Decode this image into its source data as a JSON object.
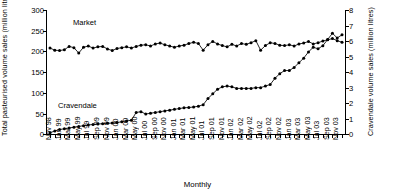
{
  "chart_data": {
    "type": "line",
    "title": "",
    "xlabel": "Monthly",
    "ylabel_left": "Total pasteurised volume sales (million litres)",
    "ylabel_right": "Cravendale volume sales (million litres)",
    "ylim_left": [
      0,
      300
    ],
    "yticks_left": [
      0,
      50,
      100,
      150,
      200,
      250,
      300
    ],
    "ylim_right": [
      0,
      8
    ],
    "yticks_right": [
      0,
      1,
      2,
      3,
      4,
      5,
      6,
      7,
      8
    ],
    "grid": false,
    "legend_position": "inline-annotations",
    "annotations": [
      {
        "text": "Market",
        "series": "Market"
      },
      {
        "text": "Cravendale",
        "series": "Cravendale"
      }
    ],
    "x_tick_labels": [
      "Nov 98",
      "Jan 99",
      "Mar 99",
      "May 99",
      "Jul 99",
      "Sep 99",
      "Nov 99",
      "Jan 00",
      "Mar 00",
      "May 00",
      "Jul 00",
      "Sep 00",
      "Nov 00",
      "Jan 01",
      "Mar 01",
      "May 01",
      "Jul 01",
      "Sep 01",
      "Nov 01",
      "Jan 02",
      "Mar 02",
      "May 02",
      "Jul 02",
      "Sep 02",
      "Nov 02",
      "Jan 03",
      "Mar 03",
      "May 03",
      "Jul 03",
      "Sep 03",
      "Nov 03"
    ],
    "x_months": [
      "Nov 98",
      "Dec 98",
      "Jan 99",
      "Feb 99",
      "Mar 99",
      "Apr 99",
      "May 99",
      "Jun 99",
      "Jul 99",
      "Aug 99",
      "Sep 99",
      "Oct 99",
      "Nov 99",
      "Dec 99",
      "Jan 00",
      "Feb 00",
      "Mar 00",
      "Apr 00",
      "May 00",
      "Jun 00",
      "Jul 00",
      "Aug 00",
      "Sep 00",
      "Oct 00",
      "Nov 00",
      "Dec 00",
      "Jan 01",
      "Feb 01",
      "Mar 01",
      "Apr 01",
      "May 01",
      "Jun 01",
      "Jul 01",
      "Aug 01",
      "Sep 01",
      "Oct 01",
      "Nov 01",
      "Dec 01",
      "Jan 02",
      "Feb 02",
      "Mar 02",
      "Apr 02",
      "May 02",
      "Jun 02",
      "Jul 02",
      "Aug 02",
      "Sep 02",
      "Oct 02",
      "Nov 02",
      "Dec 02",
      "Jan 03",
      "Feb 03",
      "Mar 03",
      "Apr 03",
      "May 03",
      "Jun 03",
      "Jul 03",
      "Aug 03",
      "Sep 03",
      "Oct 03",
      "Nov 03",
      "Dec 03"
    ],
    "series": [
      {
        "name": "Market",
        "axis": "left",
        "units": "million litres",
        "values": [
          208,
          203,
          202,
          204,
          212,
          209,
          196,
          210,
          213,
          208,
          211,
          212,
          206,
          202,
          207,
          209,
          211,
          208,
          212,
          215,
          216,
          213,
          218,
          220,
          216,
          213,
          210,
          213,
          215,
          219,
          222,
          219,
          203,
          216,
          224,
          218,
          214,
          211,
          217,
          213,
          219,
          217,
          221,
          226,
          203,
          214,
          221,
          219,
          215,
          214,
          216,
          213,
          218,
          220,
          224,
          218,
          221,
          225,
          228,
          231,
          226,
          222
        ]
      },
      {
        "name": "Cravendale",
        "axis": "right",
        "units": "million litres",
        "values": [
          0.1,
          0.2,
          0.3,
          0.35,
          0.4,
          0.45,
          0.5,
          0.55,
          0.6,
          0.62,
          0.65,
          0.68,
          0.7,
          0.72,
          0.75,
          0.8,
          0.85,
          0.9,
          1.4,
          1.45,
          1.3,
          1.35,
          1.4,
          1.45,
          1.5,
          1.55,
          1.6,
          1.65,
          1.7,
          1.72,
          1.75,
          1.8,
          1.9,
          2.3,
          2.6,
          2.9,
          3.05,
          3.1,
          3.05,
          2.95,
          2.95,
          2.95,
          2.95,
          3.0,
          3.0,
          3.1,
          3.2,
          3.6,
          3.9,
          4.1,
          4.1,
          4.3,
          4.6,
          4.9,
          5.3,
          5.6,
          5.5,
          5.7,
          6.1,
          6.5,
          6.2,
          6.4
        ]
      }
    ]
  }
}
